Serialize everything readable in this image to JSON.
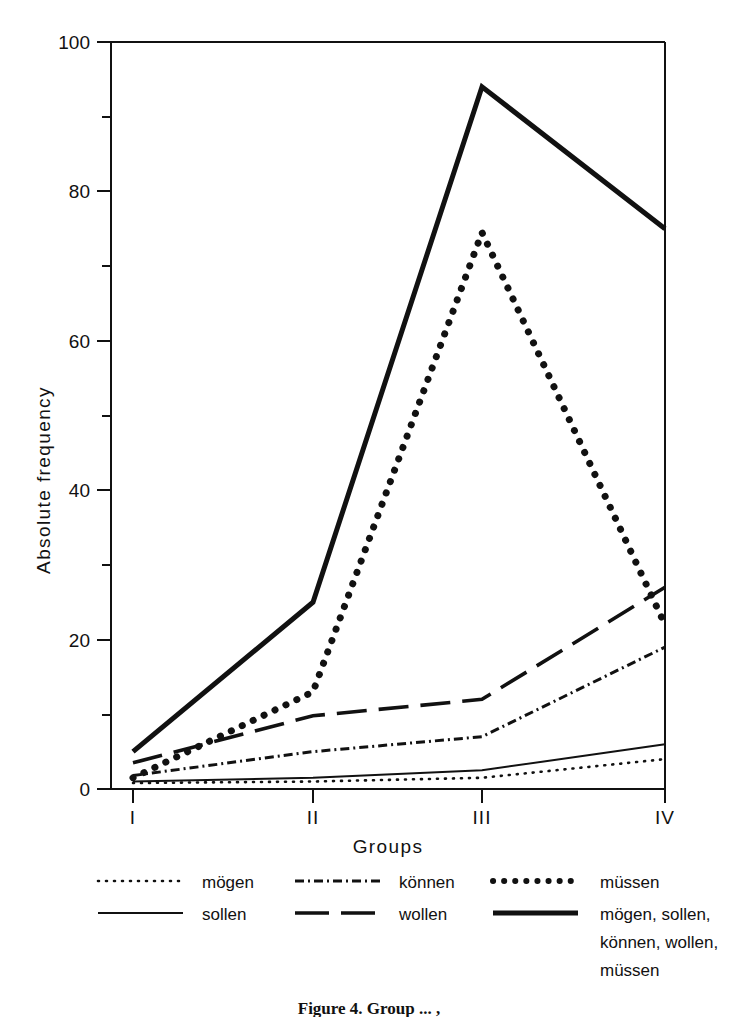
{
  "chart_data": {
    "type": "line",
    "title": "",
    "xlabel": "Groups",
    "ylabel": "Absolute frequency",
    "categories": [
      "I",
      "II",
      "III",
      "IV"
    ],
    "x_tick_labels": [
      "I",
      "II",
      "III",
      "IV"
    ],
    "y_tick_labels": [
      "0",
      "20",
      "40",
      "60",
      "80",
      "100"
    ],
    "y_ticks": [
      0,
      20,
      40,
      60,
      80,
      100
    ],
    "y_minor_ticks": [
      10,
      30,
      50,
      70,
      90
    ],
    "ylim": [
      0,
      100
    ],
    "grid": false,
    "legend_position": "below-axes",
    "series": [
      {
        "name": "mögen",
        "style": "fine-dotted",
        "values": [
          0.8,
          1.0,
          1.5,
          4.0
        ]
      },
      {
        "name": "können",
        "style": "dash-dot",
        "values": [
          1.8,
          5.0,
          7.0,
          19.0
        ]
      },
      {
        "name": "müssen",
        "style": "thick-dotted",
        "values": [
          1.5,
          13.0,
          74.5,
          22.0
        ]
      },
      {
        "name": "sollen",
        "style": "thin-solid",
        "values": [
          1.0,
          1.5,
          2.5,
          6.0
        ]
      },
      {
        "name": "wollen",
        "style": "dashed",
        "values": [
          3.5,
          9.8,
          12.0,
          27.0
        ]
      },
      {
        "name": "mögen, sollen, können, wollen, müssen",
        "style": "thick-solid",
        "values": [
          5.0,
          25.0,
          94.0,
          75.0
        ]
      }
    ]
  },
  "axes": {
    "y_axis_title": "Absolute frequency",
    "x_axis_title": "Groups",
    "y_labels": [
      "100",
      "80",
      "60",
      "40",
      "20",
      "0"
    ],
    "x_labels": [
      "I",
      "II",
      "III",
      "IV"
    ]
  },
  "legend": {
    "entries": [
      {
        "label": "mögen",
        "swatch": "fine-dotted-swatch"
      },
      {
        "label": "können",
        "swatch": "dash-dot-swatch"
      },
      {
        "label": "müssen",
        "swatch": "thick-dotted-swatch"
      },
      {
        "label": "sollen",
        "swatch": "thin-solid-swatch"
      },
      {
        "label": "wollen",
        "swatch": "dashed-swatch"
      },
      {
        "label_line1": "mögen, sollen,",
        "label_line2": "können, wollen,",
        "label_line3": "müssen",
        "swatch": "thick-solid-swatch"
      }
    ]
  },
  "caption": {
    "text": "Figure 4.  Group ... ,"
  },
  "colors": {
    "ink": "#111111",
    "background": "#ffffff"
  }
}
